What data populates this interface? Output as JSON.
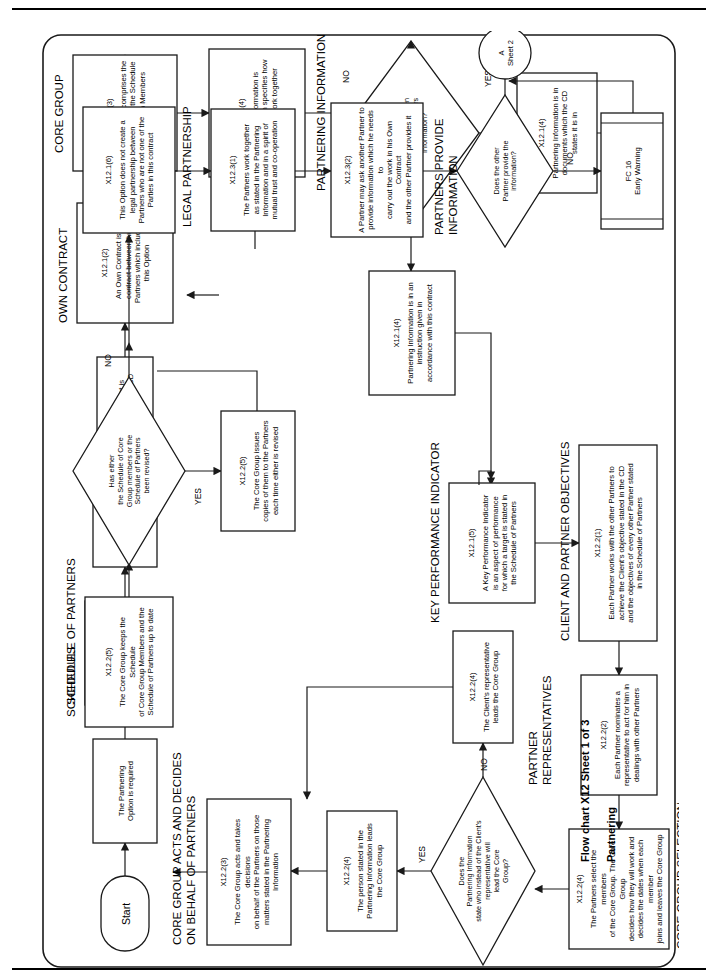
{
  "document": {
    "caption_line1": "Flow chart X12 Sheet 1 of 3",
    "caption_line2": "Partnering",
    "orientation": "landscape-rotated-90"
  },
  "section_labels": [
    {
      "id": "schedule-of-partners",
      "text": "SCHEDULE OF PARTNERS"
    },
    {
      "id": "own-contract",
      "text": "OWN CONTRACT"
    },
    {
      "id": "core-group",
      "text": "CORE GROUP"
    },
    {
      "id": "partnering-information",
      "text": "PARTNERING INFORMATION"
    },
    {
      "id": "key-performance-indicator",
      "text": "KEY PERFORMANCE INDICATOR"
    },
    {
      "id": "client-and-partner-objectives",
      "text": "CLIENT AND PARTNER OBJECTIVES"
    },
    {
      "id": "partner-representatives",
      "text": "PARTNER\nREPRESENTATIVES"
    },
    {
      "id": "core-group-selection",
      "text": "CORE GROUP SELECTION"
    },
    {
      "id": "core-group-acts",
      "text": "CORE GROUP ACTS AND DECIDES\nON BEHALF OF PARTNERS"
    },
    {
      "id": "schedules",
      "text": "SCHEDULES"
    },
    {
      "id": "legal-partnership",
      "text": "LEGAL PARTNERSHIP"
    },
    {
      "id": "partners-provide-information",
      "text": "PARTNERS PROVIDE\nINFORMATION"
    }
  ],
  "nodes": {
    "start": {
      "label": "Start"
    },
    "partnering_option": {
      "text": "The Partnering\nOption is required"
    },
    "x1211": {
      "ref": "X12.1(1)",
      "text": "The Partners are\nthose named the\nSchedule of Partners"
    },
    "x1211b": {
      "ref": "X12.1(1)",
      "text": "The Client is a\nPartner"
    },
    "client_cd": {
      "text": "The Client is\nstated in the CD"
    },
    "x1212": {
      "ref": "X12.1(2)",
      "text": "An Own Contract is a\ncontract between two\nPartners which includes\nthis Option"
    },
    "x1213": {
      "ref": "X12.1(3)",
      "text": "The Core Group comprises the\nPartners listed in the Schedule\nof Core Group Members"
    },
    "x1214_top": {
      "ref": "X12.1(4)",
      "text": "Partnering information is\ninformation which specifies how\nthe Partners work together"
    },
    "d_instruction": {
      "text": "Has an\ninstruction been given\nproviding the Partners\nInformation?",
      "yes": "YES",
      "no": "NO"
    },
    "x1214_yes": {
      "ref": "X12.1(4)",
      "text": "Partnering Information is in an\ninstruction given in\naccordance with this contract"
    },
    "x1214_no": {
      "ref": "X12.1(4)",
      "text": "Partnering Information is in\ndocuments which the CD\nstates it is in"
    },
    "x1215": {
      "ref": "X12.1(5)",
      "text": "A Key Performance Indicator\nis an aspect of performance\nfor which a target is stated in\nthe Schedule of Partners"
    },
    "x1221": {
      "ref": "X12.2(1)",
      "text": "Each Partner works with the other Partners to\nachieve the Client's objective stated in the CD\nand the objectives of every other Partner stated\nin the Schedule of Partners"
    },
    "x1222": {
      "ref": "X12.2(2)",
      "text": "Each Partner nominates a\nrepresentative to act for him in\ndealings with other Partners"
    },
    "x1224_select": {
      "ref": "X12.2(4)",
      "text": "The Partners select the members\nof the Core Group. The Core Group\ndecides how they will work and\ndecides the dates when each member\njoins and leaves the Core Group"
    },
    "d_leadcore": {
      "text": "Does the\nPartnering Information\nstate who instead of the Client's\nrepresentative will\nlead the Core\nGroup?",
      "yes": "YES",
      "no": "NO"
    },
    "x1224_person": {
      "ref": "X12.2(4)",
      "text": "The person stated in the\nPartnering Information leads\nthe Core Group"
    },
    "x1224_client": {
      "ref": "X12.2(4)",
      "text": "The Client's representative\nleads the Core Group"
    },
    "x1223": {
      "ref": "X12.2(3)",
      "text": "The Core Group acts and takes decisions\non behalf of the Partners on those\nmatters stated in the Partnering\nInformation"
    },
    "x1225_keeps": {
      "ref": "X12.2(5)",
      "text": "The Core Group keeps the Schedule\nof Core Group Members and the\nSchedule of Partners up to date"
    },
    "d_revised": {
      "text": "Has either\nthe Schedule of Core\nGroup members or the\nSchedule of Partners\nbeen revised?",
      "yes": "YES",
      "no": "NO"
    },
    "x1225_issues": {
      "ref": "X12.2(5)",
      "text": "The Core Group issues\ncopies of them to the Partners\neach time either is revised"
    },
    "x1216": {
      "ref": "X12.1(6)",
      "text": "This Option does not create a\nlegal partnership between\nPartners who are not one of the\nParties in this contract"
    },
    "x1231": {
      "ref": "X12.3(1)",
      "text": "The Partners work together\nas stated in the Partnering\nInformation and in a spirit of\nmutual trust and co-operation"
    },
    "x1232": {
      "ref": "X12.3(2)",
      "text": "A Partner may ask another Partner to\nprovide information which he needs to\ncarry out the work in his Own Contract\nand the other Partner provides it"
    },
    "d_provide": {
      "text": "Does the other\nPartner provide the\ninformation?",
      "yes": "YES",
      "no": "NO"
    },
    "fc16": {
      "text": "FC 16\nEarly Warning"
    },
    "connector_a": {
      "text": "A\nSheet 2"
    }
  },
  "colors": {
    "stroke": "#1a1a1a",
    "fill": "#ffffff",
    "text": "#000000",
    "rule": "#000000"
  }
}
